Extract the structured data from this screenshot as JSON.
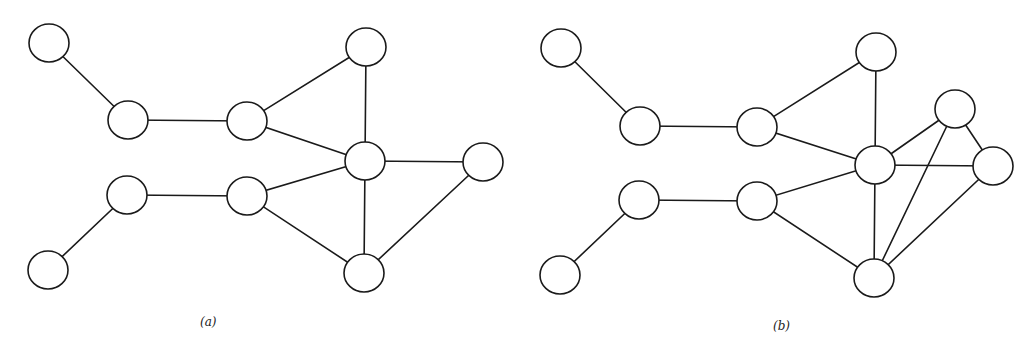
{
  "figure": {
    "node_radius": 19,
    "stroke_color": "#1a1a1a",
    "background": "#ffffff",
    "panels": [
      {
        "id": "a",
        "caption": "(a)",
        "caption_pos": [
          200,
          326
        ],
        "nodes": [
          {
            "id": "a1",
            "x": 49,
            "y": 43
          },
          {
            "id": "a2",
            "x": 128,
            "y": 120
          },
          {
            "id": "a3",
            "x": 247,
            "y": 121
          },
          {
            "id": "a4",
            "x": 366,
            "y": 47
          },
          {
            "id": "a5",
            "x": 365,
            "y": 161
          },
          {
            "id": "a6",
            "x": 483,
            "y": 162
          },
          {
            "id": "a7",
            "x": 127,
            "y": 195
          },
          {
            "id": "a8",
            "x": 247,
            "y": 196
          },
          {
            "id": "a9",
            "x": 48,
            "y": 270
          },
          {
            "id": "a10",
            "x": 364,
            "y": 273
          }
        ],
        "edges": [
          [
            "a1",
            "a2"
          ],
          [
            "a2",
            "a3"
          ],
          [
            "a3",
            "a4"
          ],
          [
            "a3",
            "a5"
          ],
          [
            "a4",
            "a5"
          ],
          [
            "a5",
            "a6"
          ],
          [
            "a5",
            "a10"
          ],
          [
            "a6",
            "a10"
          ],
          [
            "a7",
            "a8"
          ],
          [
            "a8",
            "a5"
          ],
          [
            "a8",
            "a10"
          ],
          [
            "a7",
            "a9"
          ]
        ]
      },
      {
        "id": "b",
        "caption": "(b)",
        "caption_pos": [
          773,
          330
        ],
        "nodes": [
          {
            "id": "b1",
            "x": 561,
            "y": 48
          },
          {
            "id": "b2",
            "x": 640,
            "y": 126
          },
          {
            "id": "b3",
            "x": 757,
            "y": 127
          },
          {
            "id": "b4",
            "x": 876,
            "y": 52
          },
          {
            "id": "b5",
            "x": 875,
            "y": 165
          },
          {
            "id": "b6",
            "x": 955,
            "y": 109
          },
          {
            "id": "b7",
            "x": 993,
            "y": 166
          },
          {
            "id": "b8",
            "x": 639,
            "y": 200
          },
          {
            "id": "b9",
            "x": 757,
            "y": 201
          },
          {
            "id": "b10",
            "x": 560,
            "y": 275
          },
          {
            "id": "b11",
            "x": 874,
            "y": 278
          }
        ],
        "edges": [
          [
            "b1",
            "b2"
          ],
          [
            "b2",
            "b3"
          ],
          [
            "b3",
            "b4"
          ],
          [
            "b3",
            "b5"
          ],
          [
            "b4",
            "b5"
          ],
          [
            "b5",
            "b6"
          ],
          [
            "b5",
            "b7"
          ],
          [
            "b6",
            "b7"
          ],
          [
            "b6",
            "b11"
          ],
          [
            "b5",
            "b11"
          ],
          [
            "b7",
            "b11"
          ],
          [
            "b8",
            "b9"
          ],
          [
            "b9",
            "b5"
          ],
          [
            "b9",
            "b11"
          ],
          [
            "b8",
            "b10"
          ]
        ]
      }
    ]
  }
}
